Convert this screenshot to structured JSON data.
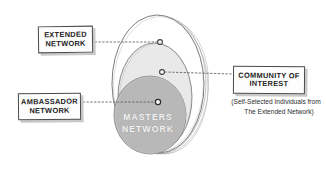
{
  "diagram": {
    "background_color": "#ffffff",
    "ink_color": "#4a4a4a",
    "rings": [
      {
        "id": "extended-network",
        "label_line1": "EXTENDED",
        "label_line2": "NETWORK",
        "fill": "#ffffff",
        "order": 1
      },
      {
        "id": "community-of-interest",
        "label_line1": "COMMUNITY OF",
        "label_line2": "INTEREST",
        "fill": "#e9e9e9",
        "order": 2
      },
      {
        "id": "ambassador-network",
        "label_line1": "AMBASSADOR",
        "label_line2": "NETWORK",
        "fill": "#b8b8b8",
        "order": 3
      }
    ],
    "center": {
      "id": "masters-network",
      "line1": "MASTERS",
      "line2": "NETWORK",
      "text_color": "#f2f2f2"
    },
    "caption": {
      "line1": "(Self-Selected Individuals from",
      "line2": "The Extended Network)"
    },
    "connectors": [
      {
        "id": "extended-connector",
        "from": "label-extended",
        "to": "ring-outer"
      },
      {
        "id": "community-connector",
        "from": "label-community",
        "to": "ring-middle"
      },
      {
        "id": "ambassador-connector",
        "from": "label-ambassador",
        "to": "ring-inner"
      }
    ]
  }
}
